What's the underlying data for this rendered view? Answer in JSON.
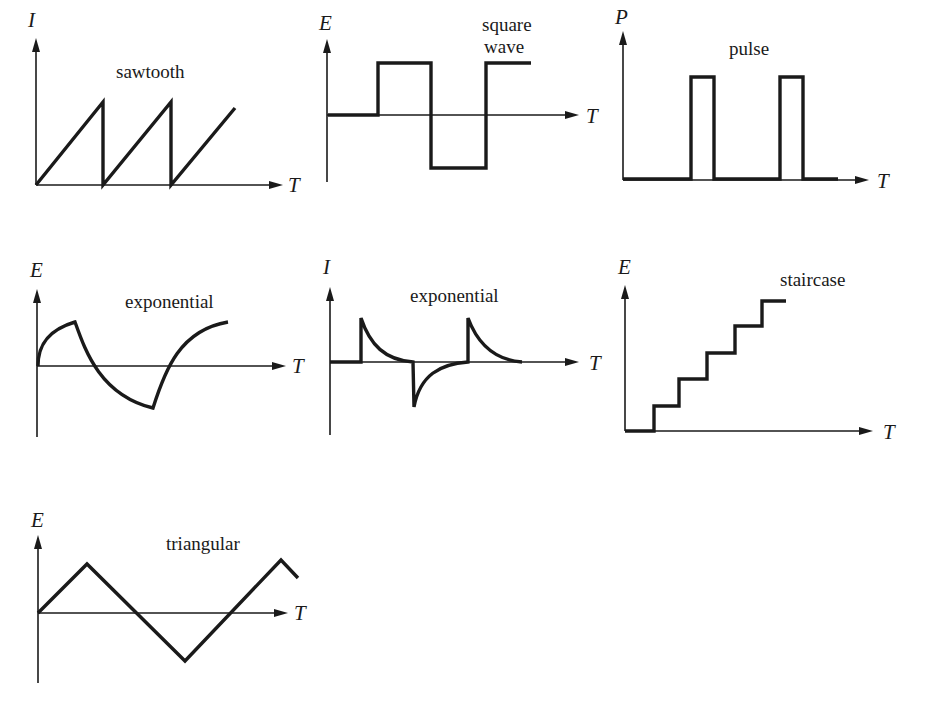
{
  "figure": {
    "panels": [
      {
        "id": "sawtooth",
        "title": "sawtooth",
        "y_axis": "I",
        "x_axis": "T"
      },
      {
        "id": "square-wave",
        "title_lines": [
          "square",
          "wave"
        ],
        "y_axis": "E",
        "x_axis": "T"
      },
      {
        "id": "pulse",
        "title": "pulse",
        "y_axis": "P",
        "x_axis": "T"
      },
      {
        "id": "exponential-voltage",
        "title": "exponential",
        "y_axis": "E",
        "x_axis": "T"
      },
      {
        "id": "exponential-current",
        "title": "exponential",
        "y_axis": "I",
        "x_axis": "T"
      },
      {
        "id": "staircase",
        "title": "staircase",
        "y_axis": "E",
        "x_axis": "T"
      },
      {
        "id": "triangular",
        "title": "triangular",
        "y_axis": "E",
        "x_axis": "T"
      }
    ]
  },
  "colors": {
    "ink": "#1a1a1a",
    "background": "#ffffff"
  }
}
